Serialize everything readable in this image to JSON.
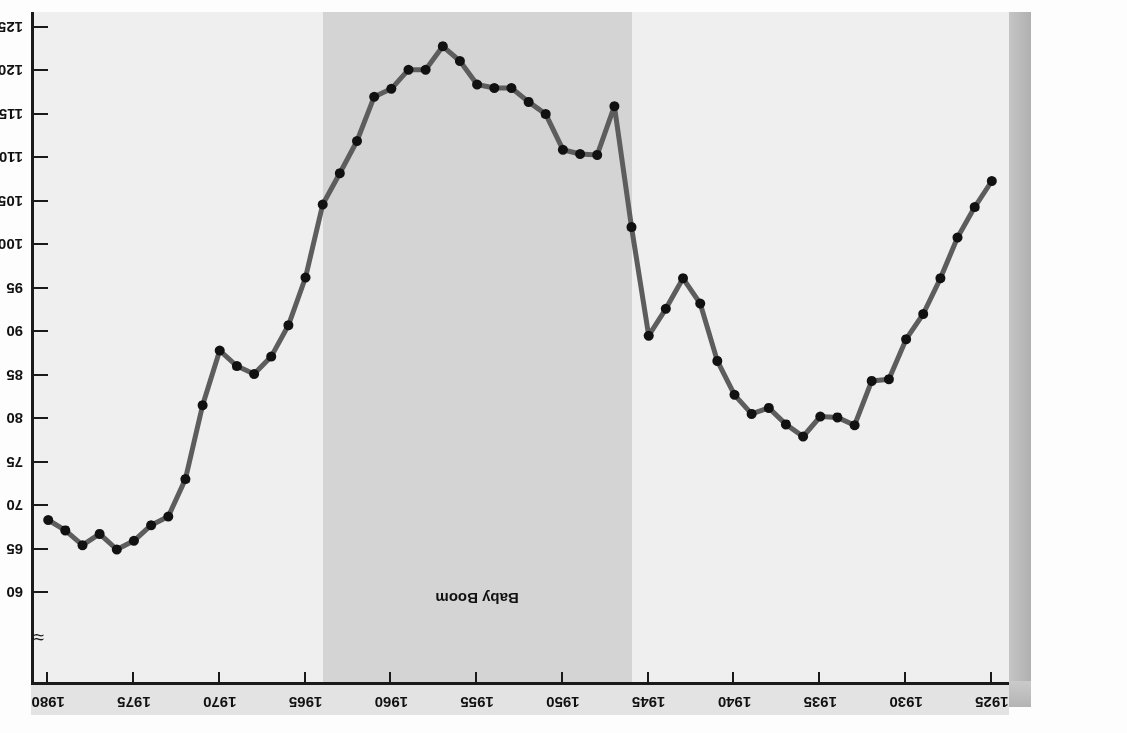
{
  "chart_data": {
    "type": "line",
    "title": "",
    "xlabel": "",
    "ylabel": "Live Births (per 1,000 Women 15–44 Years Old)",
    "xlim": [
      1924,
      1981
    ],
    "ylim": [
      60,
      125
    ],
    "y_axis_broken": true,
    "y_break_symbol": "≈",
    "grid": false,
    "legend": false,
    "x_tick_labels": [
      "1925",
      "1930",
      "1935",
      "1940",
      "1945",
      "1950",
      "1955",
      "1960",
      "1965",
      "1970",
      "1975",
      "1980"
    ],
    "y_tick_labels": [
      "60",
      "65",
      "70",
      "75",
      "80",
      "85",
      "90",
      "95",
      "100",
      "105",
      "110",
      "115",
      "120",
      "125"
    ],
    "annotations": [
      {
        "text": "Baby Boom",
        "x_start": 1946,
        "x_end": 1964
      }
    ],
    "series": [
      {
        "name": "Live births per 1,000 women aged 15-44",
        "x": [
          1925,
          1926,
          1927,
          1928,
          1929,
          1930,
          1931,
          1932,
          1933,
          1934,
          1935,
          1936,
          1937,
          1938,
          1939,
          1940,
          1941,
          1942,
          1943,
          1944,
          1945,
          1946,
          1947,
          1948,
          1949,
          1950,
          1951,
          1952,
          1953,
          1954,
          1955,
          1956,
          1957,
          1958,
          1959,
          1960,
          1961,
          1962,
          1963,
          1964,
          1965,
          1966,
          1967,
          1968,
          1969,
          1970,
          1971,
          1972,
          1973,
          1974,
          1975,
          1976,
          1977,
          1978,
          1979,
          1980
        ],
        "values": [
          107.4,
          104.4,
          100.9,
          96.2,
          92.1,
          89.2,
          84.6,
          84.4,
          79.3,
          80.2,
          80.3,
          78.0,
          79.4,
          81.3,
          80.6,
          82.8,
          86.7,
          93.3,
          96.2,
          92.7,
          89.6,
          102.1,
          116.0,
          110.4,
          110.5,
          111.0,
          115.1,
          116.5,
          118.1,
          118.1,
          118.5,
          121.2,
          122.9,
          120.2,
          120.2,
          118.0,
          117.1,
          112.0,
          108.3,
          104.7,
          96.3,
          90.8,
          87.2,
          85.2,
          86.1,
          87.9,
          81.6,
          73.1,
          68.8,
          67.8,
          66.0,
          65.0,
          66.8,
          65.5,
          67.2,
          68.4
        ]
      }
    ]
  },
  "scan_bleed_text": [
    "the early years of the century, the birth rate",
    "was declining steadily until the depression",
    "years when it reached its lowest point, and",
    "there were many fewer children born",
    "to mothers than in earlier decades.",
    "After the Second World War ended",
    "and the veterans returned home, a",
    "surge of marriages and births",
    "produced the generation known",
    "as the baby boom cohort which",
    "has shaped American society",
    "for more than half a century.",
    "The subsequent baby bust",
    "brought fertility down to",
    "levels below replacement."
  ]
}
